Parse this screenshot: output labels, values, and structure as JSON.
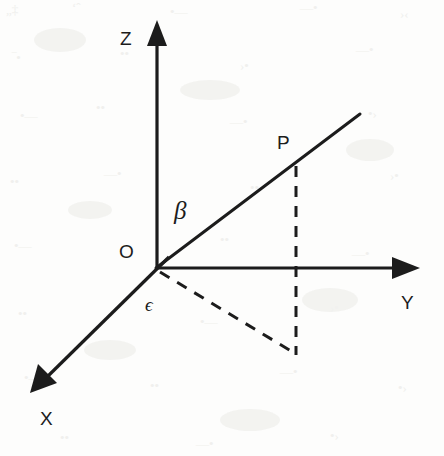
{
  "figure": {
    "kind": "3d-cartesian-axes-diagram",
    "width": 444,
    "height": 456,
    "background_color": "#fdfdfc",
    "ink_color": "#1c1c1c"
  },
  "labels": {
    "z_axis": "Z",
    "y_axis": "Y",
    "x_axis": "X",
    "origin": "O",
    "point_p": "P",
    "angle_beta": "β",
    "angle_epsilon": "ϵ"
  },
  "geometry": {
    "origin": {
      "x": 156,
      "y": 268
    },
    "z_axis": {
      "from": [
        157,
        268
      ],
      "to": [
        157,
        30
      ],
      "arrow_tip": [
        157,
        22
      ],
      "style": "solid-arrow"
    },
    "y_axis": {
      "from": [
        156,
        268
      ],
      "to": [
        404,
        268
      ],
      "arrow_tip": [
        418,
        268
      ],
      "style": "solid-arrow"
    },
    "x_axis": {
      "from": [
        168,
        258
      ],
      "to": [
        44,
        380
      ],
      "arrow_tip": [
        32,
        391
      ],
      "style": "solid-arrow"
    },
    "op_ray": {
      "from": [
        156,
        268
      ],
      "to": [
        360,
        114
      ],
      "style": "solid"
    },
    "point_p": {
      "x": 297,
      "y": 166
    },
    "projection_foot": {
      "x": 296,
      "y": 353
    },
    "vertical_dashed": {
      "from": [
        296,
        166
      ],
      "to": [
        296,
        353
      ],
      "style": "dashed"
    },
    "ground_dashed": {
      "from": [
        158,
        270
      ],
      "to": [
        296,
        353
      ],
      "style": "dashed"
    }
  },
  "label_positions": {
    "z_axis": {
      "x": 120,
      "y": 29
    },
    "y_axis": {
      "x": 401,
      "y": 293
    },
    "x_axis": {
      "x": 40,
      "y": 409
    },
    "origin": {
      "x": 119,
      "y": 242
    },
    "point_p": {
      "x": 277,
      "y": 133
    },
    "angle_beta": {
      "x": 174,
      "y": 200
    },
    "angle_epsilon": {
      "x": 145,
      "y": 295
    }
  }
}
